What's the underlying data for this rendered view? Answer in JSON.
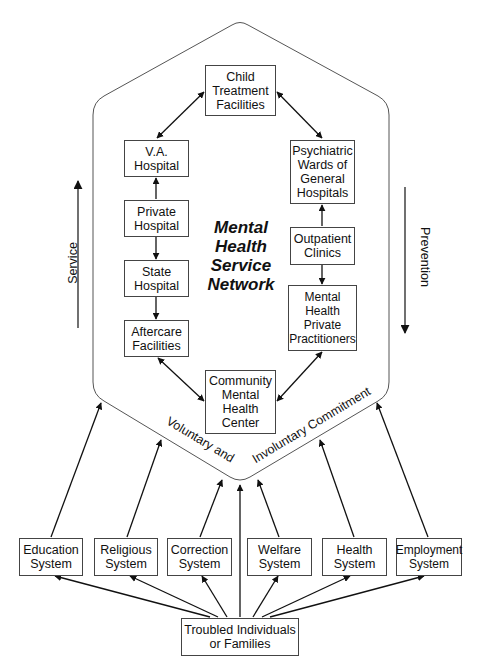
{
  "diagram": {
    "title_lines": [
      "Mental",
      "Health",
      "Service",
      "Network"
    ],
    "side_labels": {
      "left": "Service",
      "right": "Prevention"
    },
    "boundary_labels": {
      "left": "Voluntary and",
      "right": "Involuntary Commitment"
    },
    "network_nodes": {
      "child": [
        "Child",
        "Treatment",
        "Facilities"
      ],
      "va": [
        "V.A.",
        "Hospital"
      ],
      "private_hospital": [
        "Private",
        "Hospital"
      ],
      "state": [
        "State",
        "Hospital"
      ],
      "aftercare": [
        "Aftercare",
        "Facilities"
      ],
      "community": [
        "Community",
        "Mental",
        "Health",
        "Center"
      ],
      "psychiatric": [
        "Psychiatric",
        "Wards of",
        "General",
        "Hospitals"
      ],
      "outpatient": [
        "Outpatient",
        "Clinics"
      ],
      "private_practitioners": [
        "Mental",
        "Health",
        "Private",
        "Practitioners"
      ]
    },
    "systems": [
      [
        "Education",
        "System"
      ],
      [
        "Religious",
        "System"
      ],
      [
        "Correction",
        "System"
      ],
      [
        "Welfare",
        "System"
      ],
      [
        "Health",
        "System"
      ],
      [
        "Employment",
        "System"
      ]
    ],
    "source": [
      "Troubled Individuals",
      "or Families"
    ],
    "edges": [
      {
        "from": "child",
        "to": "va",
        "type": "bidirectional"
      },
      {
        "from": "child",
        "to": "psychiatric",
        "type": "bidirectional"
      },
      {
        "from": "private_hospital",
        "to": "va",
        "type": "directed"
      },
      {
        "from": "private_hospital",
        "to": "state",
        "type": "directed"
      },
      {
        "from": "state",
        "to": "aftercare",
        "type": "directed"
      },
      {
        "from": "aftercare",
        "to": "community",
        "type": "bidirectional"
      },
      {
        "from": "outpatient",
        "to": "psychiatric",
        "type": "directed"
      },
      {
        "from": "outpatient",
        "to": "private_practitioners",
        "type": "directed"
      },
      {
        "from": "private_practitioners",
        "to": "community",
        "type": "bidirectional"
      },
      {
        "from": "source",
        "to": "each system",
        "type": "directed"
      },
      {
        "from": "source",
        "to": "network",
        "type": "directed"
      },
      {
        "from": "each system",
        "to": "network",
        "type": "directed"
      }
    ],
    "colors": {
      "line": "#111111",
      "box_border": "#444444",
      "background": "#ffffff"
    }
  }
}
